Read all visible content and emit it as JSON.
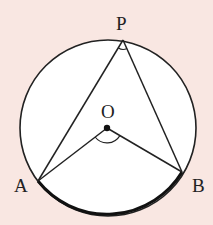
{
  "diagram": {
    "type": "circle-inscribed-angle",
    "background_color": "#f9e7e2",
    "circle_fill": "#ffffff",
    "stroke_color": "#222222",
    "circle": {
      "cx": 108,
      "cy": 128,
      "r": 88
    },
    "points": {
      "P": {
        "label": "P",
        "x": 123,
        "y": 40
      },
      "O": {
        "label": "O",
        "x": 107,
        "y": 128
      },
      "A": {
        "label": "A",
        "x": 38,
        "y": 181
      },
      "B": {
        "label": "B",
        "x": 182,
        "y": 172
      }
    },
    "segments": [
      "PA",
      "PB",
      "OA",
      "OB"
    ],
    "highlighted_arc": "AB (minor arc, bold)",
    "angle_marks": [
      "APB",
      "AOB"
    ]
  }
}
